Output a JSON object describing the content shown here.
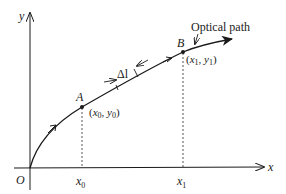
{
  "diagram": {
    "type": "optical-path-coordinate-diagram",
    "axes": {
      "x_label": "x",
      "y_label": "y",
      "origin_label": "O"
    },
    "curve": {
      "label": "Optical path",
      "segment_label": "Δl"
    },
    "points": [
      {
        "name": "A",
        "coord_label": "(x0, y0)",
        "x_sym": "x",
        "x_sub": "0",
        "y_sym": "y",
        "y_sub": "0"
      },
      {
        "name": "B",
        "coord_label": "(x1, y1)",
        "x_sym": "x",
        "x_sub": "1",
        "y_sym": "y",
        "y_sub": "1"
      }
    ],
    "x_ticks": [
      {
        "sym": "x",
        "sub": "0"
      },
      {
        "sym": "x",
        "sub": "1"
      }
    ],
    "colors": {
      "stroke": "#1a1a1a",
      "background": "#ffffff"
    }
  }
}
